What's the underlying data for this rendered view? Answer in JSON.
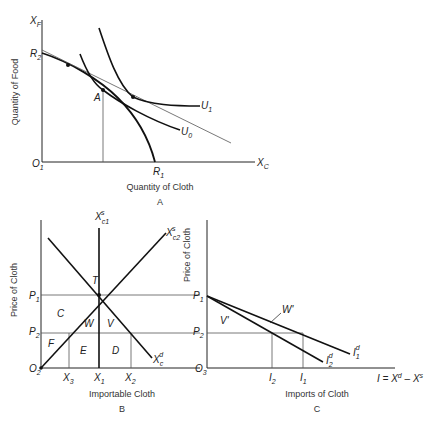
{
  "panels": [
    {
      "id": "A",
      "caption": "A",
      "xlabel": "Quantity of Cloth",
      "ylabel": "Quantity of Food",
      "x_axis_symbol": "X",
      "x_axis_sub": "C",
      "y_axis_symbol": "X",
      "y_axis_sub": "F",
      "origin": "O",
      "origin_sub": "1",
      "labels": {
        "R2": "R",
        "R2_sub": "2",
        "R1": "R",
        "R1_sub": "1",
        "A": "A",
        "U1": "U",
        "U1_sub": "1",
        "U0": "U",
        "U0_sub": "0"
      }
    },
    {
      "id": "B",
      "caption": "B",
      "xlabel": "Importable Cloth",
      "ylabel": "Price of Cloth",
      "origin": "O",
      "origin_sub": "2",
      "prices": [
        {
          "sym": "P",
          "sub": "1"
        },
        {
          "sym": "P",
          "sub": "2"
        }
      ],
      "quantities": [
        {
          "sym": "X",
          "sub": "3"
        },
        {
          "sym": "X",
          "sub": "1"
        },
        {
          "sym": "X",
          "sub": "2"
        }
      ],
      "curves": {
        "supply1": {
          "sym": "X",
          "sub": "c1",
          "sup": "s"
        },
        "supply2": {
          "sym": "X",
          "sub": "c2",
          "sup": "s"
        },
        "demand": {
          "sym": "X",
          "sub": "c",
          "sup": "d"
        }
      },
      "areas": [
        "T",
        "C",
        "W",
        "V",
        "F",
        "E",
        "D"
      ]
    },
    {
      "id": "C",
      "caption": "C",
      "xlabel": "Imports of Cloth",
      "ylabel": "Price of Cloth",
      "origin": "O",
      "origin_sub": "3",
      "x_axis_equation": "I = X",
      "x_eq_d": "d",
      "x_eq_mid": " – X",
      "x_eq_s": "s",
      "prices": [
        {
          "sym": "P",
          "sub": "1"
        },
        {
          "sym": "P",
          "sub": "2"
        }
      ],
      "quantities": [
        {
          "sym": "I",
          "sub": "2"
        },
        {
          "sym": "I",
          "sub": "1"
        }
      ],
      "curves": {
        "import1": {
          "sym": "I",
          "sub": "1",
          "sup": "d"
        },
        "import2": {
          "sym": "I",
          "sub": "2",
          "sup": "d"
        }
      },
      "areas": [
        "V'",
        "W'"
      ]
    }
  ]
}
